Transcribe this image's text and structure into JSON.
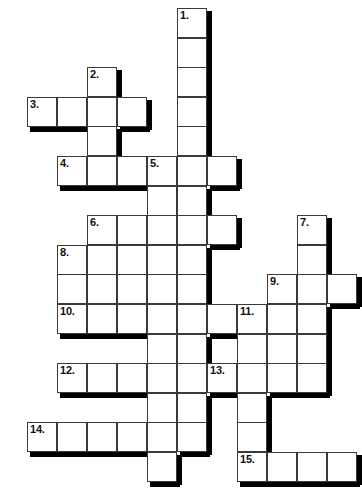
{
  "puzzle": {
    "type": "crossword-grid",
    "title": "Crossword Puzzle Grid",
    "cell_size": 30,
    "origin": {
      "x": 27,
      "y": 8
    },
    "row_step": 29.6,
    "grid_columns": 11,
    "grid_rows": 16,
    "colors": {
      "cell_fill": "#ffffff",
      "cell_border": "#3a3a3a",
      "shadow": "#000000",
      "number_text": "#111111",
      "page_background": "#ffffff"
    },
    "clue_count": 15,
    "clue_numbers": [
      "1.",
      "2.",
      "3.",
      "4.",
      "5.",
      "6.",
      "7.",
      "8.",
      "9.",
      "10.",
      "11.",
      "12.",
      "13.",
      "14.",
      "15."
    ],
    "entries": [
      {
        "number": "1.",
        "direction": "down",
        "col": 5,
        "row": 0,
        "length": 6
      },
      {
        "number": "2.",
        "direction": "down",
        "col": 2,
        "row": 2,
        "length": 4
      },
      {
        "number": "3.",
        "direction": "across",
        "col": 0,
        "row": 3,
        "length": 4
      },
      {
        "number": "4.",
        "direction": "across",
        "col": 1,
        "row": 5,
        "length": 7
      },
      {
        "number": "5.",
        "direction": "down",
        "col": 4,
        "row": 5,
        "length": 6
      },
      {
        "number": "6.",
        "direction": "across",
        "col": 2,
        "row": 7,
        "length": 5
      },
      {
        "number": "7.",
        "direction": "down",
        "col": 9,
        "row": 7,
        "length": 6
      },
      {
        "number": "8.",
        "direction": "down",
        "col": 1,
        "row": 8,
        "length": 3
      },
      {
        "number": "9.",
        "direction": "across",
        "col": 8,
        "row": 9,
        "length": 3
      },
      {
        "number": "10.",
        "direction": "across",
        "col": 1,
        "row": 10,
        "length": 7
      },
      {
        "number": "11.",
        "direction": "down",
        "col": 8,
        "row": 10,
        "length": 6
      },
      {
        "number": "12.",
        "direction": "across",
        "col": 1,
        "row": 12,
        "length": 4
      },
      {
        "number": "13.",
        "direction": "across",
        "col": 6,
        "row": 12,
        "length": 4
      },
      {
        "number": "14.",
        "direction": "across",
        "col": 0,
        "row": 14,
        "length": 6
      },
      {
        "number": "15.",
        "direction": "across",
        "col": 7,
        "row": 15,
        "length": 4
      }
    ],
    "cells": [
      {
        "col": 5,
        "row": 0,
        "num": "1."
      },
      {
        "col": 5,
        "row": 1,
        "num": ""
      },
      {
        "col": 2,
        "row": 2,
        "num": "2."
      },
      {
        "col": 5,
        "row": 2,
        "num": ""
      },
      {
        "col": 0,
        "row": 3,
        "num": "3."
      },
      {
        "col": 1,
        "row": 3,
        "num": ""
      },
      {
        "col": 2,
        "row": 3,
        "num": ""
      },
      {
        "col": 3,
        "row": 3,
        "num": ""
      },
      {
        "col": 5,
        "row": 3,
        "num": ""
      },
      {
        "col": 2,
        "row": 4,
        "num": ""
      },
      {
        "col": 5,
        "row": 4,
        "num": ""
      },
      {
        "col": 1,
        "row": 5,
        "num": "4."
      },
      {
        "col": 2,
        "row": 5,
        "num": ""
      },
      {
        "col": 3,
        "row": 5,
        "num": ""
      },
      {
        "col": 4,
        "row": 5,
        "num": "5."
      },
      {
        "col": 5,
        "row": 5,
        "num": ""
      },
      {
        "col": 6,
        "row": 5,
        "num": ""
      },
      {
        "col": 4,
        "row": 6,
        "num": ""
      },
      {
        "col": 5,
        "row": 6,
        "num": ""
      },
      {
        "col": 2,
        "row": 7,
        "num": "6."
      },
      {
        "col": 3,
        "row": 7,
        "num": ""
      },
      {
        "col": 4,
        "row": 7,
        "num": ""
      },
      {
        "col": 5,
        "row": 7,
        "num": ""
      },
      {
        "col": 6,
        "row": 7,
        "num": ""
      },
      {
        "col": 9,
        "row": 7,
        "num": "7."
      },
      {
        "col": 1,
        "row": 8,
        "num": "8."
      },
      {
        "col": 2,
        "row": 8,
        "num": ""
      },
      {
        "col": 3,
        "row": 8,
        "num": ""
      },
      {
        "col": 4,
        "row": 8,
        "num": ""
      },
      {
        "col": 5,
        "row": 8,
        "num": ""
      },
      {
        "col": 9,
        "row": 8,
        "num": ""
      },
      {
        "col": 1,
        "row": 9,
        "num": ""
      },
      {
        "col": 2,
        "row": 9,
        "num": ""
      },
      {
        "col": 3,
        "row": 9,
        "num": ""
      },
      {
        "col": 4,
        "row": 9,
        "num": ""
      },
      {
        "col": 5,
        "row": 9,
        "num": ""
      },
      {
        "col": 8,
        "row": 9,
        "num": "9."
      },
      {
        "col": 9,
        "row": 9,
        "num": ""
      },
      {
        "col": 10,
        "row": 9,
        "num": ""
      },
      {
        "col": 1,
        "row": 10,
        "num": "10."
      },
      {
        "col": 2,
        "row": 10,
        "num": ""
      },
      {
        "col": 3,
        "row": 10,
        "num": ""
      },
      {
        "col": 4,
        "row": 10,
        "num": ""
      },
      {
        "col": 5,
        "row": 10,
        "num": ""
      },
      {
        "col": 6,
        "row": 10,
        "num": ""
      },
      {
        "col": 7,
        "row": 10,
        "num": "11."
      },
      {
        "col": 8,
        "row": 10,
        "num": ""
      },
      {
        "col": 9,
        "row": 10,
        "num": ""
      },
      {
        "col": 4,
        "row": 11,
        "num": ""
      },
      {
        "col": 5,
        "row": 11,
        "num": ""
      },
      {
        "col": 7,
        "row": 11,
        "num": ""
      },
      {
        "col": 8,
        "row": 11,
        "num": ""
      },
      {
        "col": 9,
        "row": 11,
        "num": ""
      },
      {
        "col": 1,
        "row": 12,
        "num": "12."
      },
      {
        "col": 2,
        "row": 12,
        "num": ""
      },
      {
        "col": 3,
        "row": 12,
        "num": ""
      },
      {
        "col": 4,
        "row": 12,
        "num": ""
      },
      {
        "col": 5,
        "row": 12,
        "num": ""
      },
      {
        "col": 6,
        "row": 12,
        "num": "13."
      },
      {
        "col": 7,
        "row": 12,
        "num": ""
      },
      {
        "col": 8,
        "row": 12,
        "num": ""
      },
      {
        "col": 9,
        "row": 12,
        "num": ""
      },
      {
        "col": 4,
        "row": 13,
        "num": ""
      },
      {
        "col": 5,
        "row": 13,
        "num": ""
      },
      {
        "col": 7,
        "row": 13,
        "num": ""
      },
      {
        "col": 0,
        "row": 14,
        "num": "14."
      },
      {
        "col": 1,
        "row": 14,
        "num": ""
      },
      {
        "col": 2,
        "row": 14,
        "num": ""
      },
      {
        "col": 3,
        "row": 14,
        "num": ""
      },
      {
        "col": 4,
        "row": 14,
        "num": ""
      },
      {
        "col": 5,
        "row": 14,
        "num": ""
      },
      {
        "col": 7,
        "row": 14,
        "num": ""
      },
      {
        "col": 4,
        "row": 15,
        "num": ""
      },
      {
        "col": 7,
        "row": 15,
        "num": "15."
      },
      {
        "col": 8,
        "row": 15,
        "num": ""
      },
      {
        "col": 9,
        "row": 15,
        "num": ""
      },
      {
        "col": 10,
        "row": 15,
        "num": ""
      }
    ]
  }
}
